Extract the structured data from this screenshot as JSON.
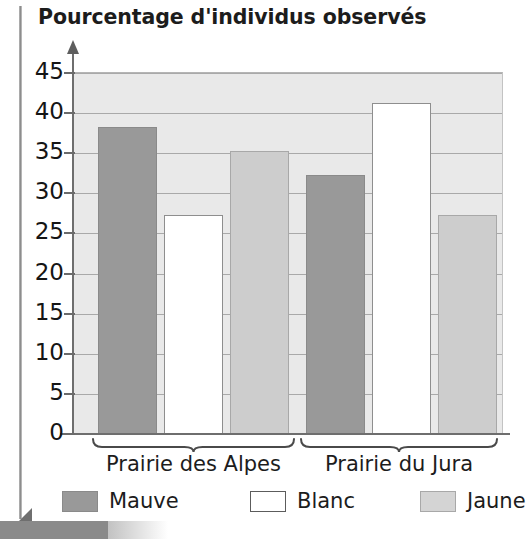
{
  "chart_data": {
    "type": "bar",
    "title": "Pourcentage d'individus observés",
    "xlabel": "",
    "ylabel": "",
    "ylim": [
      0,
      45
    ],
    "yticks": [
      0,
      5,
      10,
      15,
      20,
      25,
      30,
      35,
      40,
      45
    ],
    "grid": true,
    "legend_position": "bottom",
    "categories": [
      "Prairie des Alpes",
      "Prairie du Jura"
    ],
    "series": [
      {
        "name": "Mauve",
        "color": "#999999",
        "values": [
          38,
          32
        ]
      },
      {
        "name": "Blanc",
        "color": "#ffffff",
        "values": [
          27,
          41
        ]
      },
      {
        "name": "Jaune",
        "color": "#cdcdcd",
        "values": [
          35,
          27
        ]
      }
    ]
  },
  "axis": {
    "tick_labels": [
      "45",
      "40",
      "35",
      "30",
      "25",
      "20",
      "15",
      "10",
      "5",
      "0"
    ]
  },
  "groups": [
    {
      "label": "Prairie des Alpes"
    },
    {
      "label": "Prairie du Jura"
    }
  ],
  "legend": {
    "items": [
      {
        "label": "Mauve"
      },
      {
        "label": "Blanc"
      },
      {
        "label": "Jaune"
      }
    ]
  },
  "colors": {
    "mauve": "#999999",
    "blanc": "#ffffff",
    "jaune": "#cdcdcd",
    "plot_background": "#e9e9e9",
    "gridline": "#a9a9a9",
    "axis": "#6e6e6e"
  }
}
